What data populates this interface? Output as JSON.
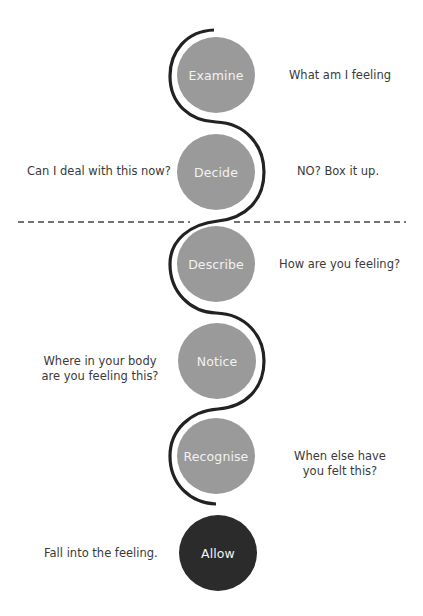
{
  "diagram": {
    "colors": {
      "circle": "#9a9a9a",
      "circle_final": "#2b2b2b",
      "circle_text": "#f2f2f2",
      "curve": "#222222",
      "text": "#3a3a3a",
      "divider": "#444444"
    },
    "steps": [
      {
        "label": "Examine",
        "left_text": "",
        "right_text": "What am I feeling"
      },
      {
        "label": "Decide",
        "left_text": "Can I deal with this now?",
        "right_text": "NO? Box it up."
      },
      {
        "label": "Describe",
        "left_text": "",
        "right_text": "How are you feeling?"
      },
      {
        "label": "Notice",
        "left_text": "Where in your body\nare you feeling this?",
        "left_line1": "Where in your body",
        "left_line2": "are you feeling this?",
        "right_text": ""
      },
      {
        "label": "Recognise",
        "left_text": "",
        "right_text": "When else have\nyou felt this?",
        "right_line1": "When else have",
        "right_line2": "you felt this?"
      },
      {
        "label": "Allow",
        "left_text": "Fall into the feeling.",
        "right_text": ""
      }
    ]
  }
}
